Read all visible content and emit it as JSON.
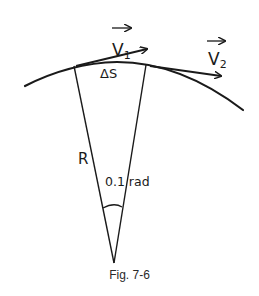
{
  "diagram": {
    "labels": {
      "v1": "V",
      "v1_sub": "1",
      "v2": "V",
      "v2_sub": "2",
      "arc_length": "ΔS",
      "radius": "R",
      "angle": "0.1 rad"
    },
    "caption": "Fig. 7-6",
    "colors": {
      "stroke": "#1a1a1a",
      "background": "#ffffff"
    }
  }
}
